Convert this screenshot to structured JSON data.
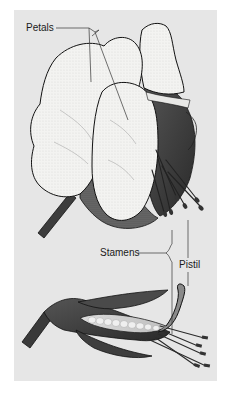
{
  "diagram": {
    "views": [
      "whole-flower",
      "cross-section"
    ],
    "labels": {
      "petals": "Petals",
      "stamens": "Stamens",
      "pistil": "Pistil"
    },
    "colors": {
      "background": "#e6e6e6",
      "petal_fill": "#f4f4f2",
      "shadow": "#4a4a4a",
      "ink": "#1a1a1a"
    }
  }
}
